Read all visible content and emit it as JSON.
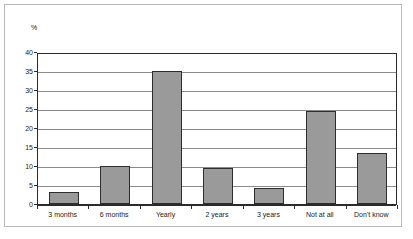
{
  "chart_data": {
    "type": "bar",
    "title": "",
    "subtitle": "",
    "xlabel": "",
    "ylabel": "%",
    "ylim": [
      0,
      40
    ],
    "ytick_step": 5,
    "yticks": [
      0,
      5,
      10,
      15,
      20,
      25,
      30,
      35,
      40
    ],
    "ytick_labels": [
      "0",
      "5",
      "10",
      "15",
      "20",
      "25",
      "30",
      "35",
      "40"
    ],
    "grid": true,
    "grid_axis": "y",
    "legend": false,
    "legend_position": "none",
    "categories": [
      "3 months",
      "6 months",
      "Yearly",
      "2 years",
      "3 years",
      "Not at all",
      "Don't know"
    ],
    "values": [
      3.2,
      10.0,
      35.0,
      9.4,
      4.2,
      24.5,
      13.3
    ],
    "series": [
      {
        "name": "",
        "values": [
          3.2,
          10.0,
          35.0,
          9.4,
          4.2,
          24.5,
          13.3
        ]
      }
    ],
    "bar_color": "#9a9a9a",
    "bar_edge_color": "#2d2d2d",
    "plot_background": "#ffffff",
    "axis_color": "#2b2b2b",
    "gridline_color": "#8a8a8a",
    "frame_color": "#b8b8b8"
  }
}
